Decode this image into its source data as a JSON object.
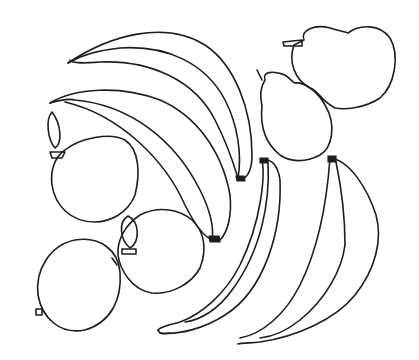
{
  "image": {
    "description": "Black line drawing of assorted fruit",
    "background": "#ffffff",
    "stroke_color": "#1e1e1e",
    "objects": [
      {
        "type": "banana",
        "count": 4
      },
      {
        "type": "apple",
        "count": 3
      },
      {
        "type": "pear",
        "count": 2
      }
    ]
  }
}
